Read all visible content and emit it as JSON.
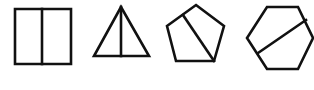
{
  "figure": {
    "stroke_color": "#111111",
    "stroke_width": 2.6,
    "background": "#ffffff"
  },
  "shapes": [
    {
      "name": "square",
      "type": "polygon",
      "points": [
        [
          15,
          9
        ],
        [
          71,
          9
        ],
        [
          71,
          64
        ],
        [
          15,
          64
        ]
      ],
      "divider": [
        [
          42,
          9
        ],
        [
          42,
          64
        ]
      ],
      "divider_description": "vertical line through the middle"
    },
    {
      "name": "triangle",
      "type": "polygon",
      "points": [
        [
          121,
          7
        ],
        [
          149,
          56
        ],
        [
          94,
          56
        ]
      ],
      "divider": [
        [
          121,
          7
        ],
        [
          121,
          56
        ]
      ],
      "divider_description": "vertical line from apex to base"
    },
    {
      "name": "pentagon",
      "type": "polygon",
      "points": [
        [
          196,
          5
        ],
        [
          224,
          26
        ],
        [
          214,
          61
        ],
        [
          176,
          61
        ],
        [
          167,
          26
        ]
      ],
      "divider": [
        [
          183,
          15
        ],
        [
          214,
          61
        ]
      ],
      "divider_description": "line from upper-left edge to lower-right vertex"
    },
    {
      "name": "hexagon",
      "type": "polygon",
      "points": [
        [
          267,
          7
        ],
        [
          298,
          7
        ],
        [
          313,
          38
        ],
        [
          298,
          69
        ],
        [
          267,
          69
        ],
        [
          247,
          38
        ]
      ],
      "divider": [
        [
          258,
          53
        ],
        [
          306,
          20
        ]
      ],
      "divider_description": "diagonal line from lower-left edge to upper-right edge"
    }
  ]
}
